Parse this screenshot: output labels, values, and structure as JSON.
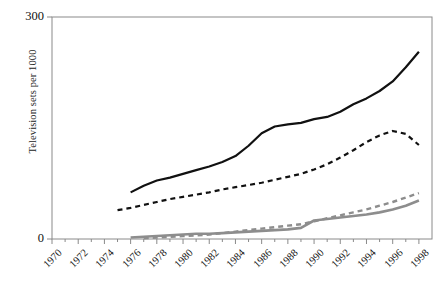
{
  "chart_data": {
    "type": "line",
    "title": "",
    "xlabel": "",
    "ylabel": "Television sets per 1000",
    "xlim": [
      1970,
      1999
    ],
    "ylim": [
      0,
      300
    ],
    "yticks": [
      0,
      300
    ],
    "ytick_labels": [
      "0",
      "300"
    ],
    "xticks": [
      1970,
      1972,
      1974,
      1976,
      1978,
      1980,
      1982,
      1984,
      1986,
      1988,
      1990,
      1992,
      1994,
      1996,
      1998
    ],
    "xtick_labels": [
      "1970",
      "1972",
      "1974",
      "1976",
      "1978",
      "1980",
      "1982",
      "1984",
      "1986",
      "1988",
      "1990",
      "1992",
      "1994",
      "1996",
      "1998"
    ],
    "grid": false,
    "legend": "none",
    "colors": {
      "series_black": "#111111",
      "series_gray": "#8d8d8d",
      "axis": "#8a8a8a",
      "text": "#111111",
      "background": "#ffffff"
    },
    "series": [
      {
        "name": "black-solid",
        "style": "solid",
        "color": "#111111",
        "width": 2.2,
        "x": [
          1976,
          1977,
          1978,
          1979,
          1980,
          1981,
          1982,
          1983,
          1984,
          1985,
          1986,
          1987,
          1988,
          1989,
          1990,
          1991,
          1992,
          1993,
          1994,
          1995,
          1996,
          1997,
          1998
        ],
        "values": [
          63,
          72,
          79,
          83,
          88,
          93,
          98,
          104,
          112,
          126,
          143,
          152,
          155,
          157,
          162,
          165,
          172,
          182,
          190,
          200,
          213,
          232,
          253
        ]
      },
      {
        "name": "black-dashed",
        "style": "dashed",
        "color": "#111111",
        "width": 2.2,
        "x": [
          1975,
          1976,
          1977,
          1978,
          1979,
          1980,
          1981,
          1982,
          1983,
          1984,
          1985,
          1986,
          1987,
          1988,
          1989,
          1990,
          1991,
          1992,
          1993,
          1994,
          1995,
          1996,
          1997,
          1998
        ],
        "values": [
          39,
          42,
          46,
          50,
          54,
          57,
          60,
          63,
          67,
          70,
          73,
          76,
          80,
          84,
          88,
          94,
          101,
          110,
          120,
          131,
          140,
          146,
          142,
          127
        ]
      },
      {
        "name": "gray-solid",
        "style": "solid",
        "color": "#8d8d8d",
        "width": 2.6,
        "x": [
          1976,
          1977,
          1978,
          1979,
          1980,
          1981,
          1982,
          1983,
          1984,
          1985,
          1986,
          1987,
          1988,
          1989,
          1990,
          1991,
          1992,
          1993,
          1994,
          1995,
          1996,
          1997,
          1998
        ],
        "values": [
          2,
          3,
          4,
          5,
          6,
          7,
          7,
          8,
          9,
          10,
          11,
          12,
          13,
          15,
          25,
          27,
          29,
          31,
          33,
          36,
          40,
          45,
          52
        ]
      },
      {
        "name": "gray-dashed",
        "style": "dashed",
        "color": "#8d8d8d",
        "width": 2.4,
        "x": [
          1977,
          1978,
          1979,
          1980,
          1981,
          1982,
          1983,
          1984,
          1985,
          1986,
          1987,
          1988,
          1989,
          1990,
          1991,
          1992,
          1993,
          1994,
          1995,
          1996,
          1997,
          1998
        ],
        "values": [
          1,
          2,
          3,
          4,
          5,
          6,
          8,
          10,
          12,
          14,
          16,
          18,
          20,
          24,
          28,
          32,
          36,
          40,
          45,
          50,
          56,
          62
        ]
      }
    ]
  }
}
